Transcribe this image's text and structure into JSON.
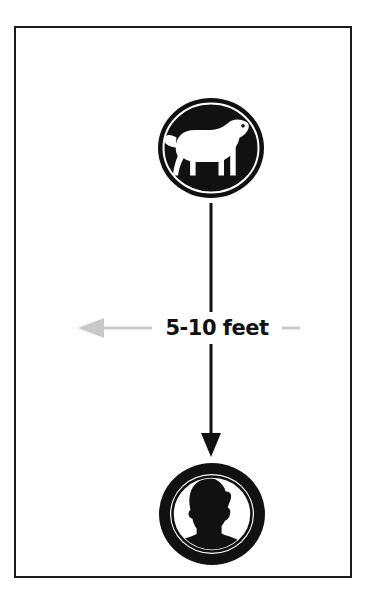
{
  "diagram": {
    "title": "Safe distance between dog and person",
    "background_color": "#ffffff",
    "frame": {
      "name": "outer-border",
      "stroke_color": "#1a1a1a",
      "stroke_width": 2
    },
    "nodes": [
      {
        "id": "dog",
        "icon": "dog-icon",
        "label": "Dog",
        "style": "black filled circle with inner white ring and white dog silhouette facing right",
        "fill_color": "#111111",
        "silhouette_color": "#ffffff"
      },
      {
        "id": "person",
        "icon": "person-head-icon",
        "label": "Person",
        "style": "thick black ring with white interior and black head-and-shoulders silhouette facing right",
        "fill_color": "#111111",
        "silhouette_color": "#111111"
      }
    ],
    "connector": {
      "name": "vertical-arrow",
      "from": "dog",
      "to": "person",
      "direction": "down",
      "color": "#111111"
    },
    "measure": {
      "name": "distance-measure",
      "text": "5-10 feet",
      "arrow_direction": "left",
      "arrow_color": "#c9c9c9",
      "tick_color": "#c9c9c9",
      "text_color": "#111111"
    }
  }
}
